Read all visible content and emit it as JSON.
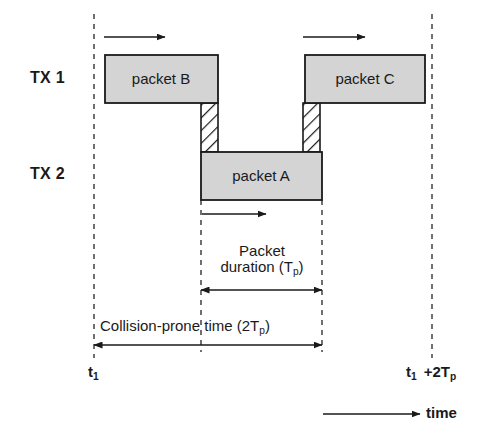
{
  "figure": {
    "type": "timing-diagram",
    "title_text": "",
    "background_color": "#ffffff",
    "line_color": "#1a1a1a",
    "box_fill_color": "#d4d4d4",
    "box_stroke_color": "#1a1a1a",
    "hatch_fill_color": "#ffffff",
    "dashed_guide_color": "#4d4d4d"
  },
  "rows": [
    {
      "id": "tx1",
      "label": "TX 1",
      "label_x": 30,
      "label_y": 70
    },
    {
      "id": "tx2",
      "label": "TX 2",
      "label_x": 30,
      "label_y": 166
    }
  ],
  "guides": [
    {
      "id": "t1-line",
      "x": 94,
      "y1": 14,
      "y2": 358
    },
    {
      "id": "packet-start",
      "x": 201,
      "y1": 200,
      "y2": 352
    },
    {
      "id": "packet-end",
      "x": 322,
      "y1": 200,
      "y2": 352
    },
    {
      "id": "t1-plus-2tp",
      "x": 432,
      "y1": 14,
      "y2": 358
    }
  ],
  "packets": [
    {
      "id": "packet-b",
      "label": "packet B",
      "row": "tx1",
      "x": 105,
      "y": 55,
      "w": 113,
      "h": 48
    },
    {
      "id": "packet-c",
      "label": "packet C",
      "row": "tx1",
      "x": 305,
      "y": 55,
      "w": 120,
      "h": 48
    },
    {
      "id": "packet-a",
      "label": "packet A",
      "row": "tx2",
      "x": 201,
      "y": 152,
      "w": 121,
      "h": 48
    }
  ],
  "hatched_regions": [
    {
      "id": "collision-window-left",
      "x": 201,
      "y": 103,
      "w": 17,
      "h": 49
    },
    {
      "id": "collision-window-right",
      "x": 303,
      "y": 103,
      "w": 17,
      "h": 49
    }
  ],
  "propagation_arrows": [
    {
      "id": "arrow-packet-b",
      "x1": 104,
      "y1": 37,
      "x2": 165,
      "y2": 37
    },
    {
      "id": "arrow-packet-c",
      "x1": 303,
      "y1": 37,
      "x2": 365,
      "y2": 37
    },
    {
      "id": "arrow-packet-a",
      "x1": 202,
      "y1": 214,
      "x2": 266,
      "y2": 214
    }
  ],
  "measures": [
    {
      "id": "packet-duration",
      "text_line1": "Packet",
      "text_line2_prefix": "duration (T",
      "text_sub": "p",
      "text_line2_suffix": ")",
      "text_x": 262,
      "text_y": 243,
      "arrow_x1": 201,
      "arrow_x2": 322,
      "arrow_y": 290
    },
    {
      "id": "collision-prone-time",
      "text_line1": "",
      "text_line2_prefix": "Collision-prone time (2T",
      "text_sub": "p",
      "text_line2_suffix": ")",
      "text_x": 210,
      "text_y": 318,
      "arrow_x1": 94,
      "arrow_x2": 322,
      "arrow_y": 345
    }
  ],
  "tick_labels": [
    {
      "id": "t1",
      "prefix": "t",
      "sub": "1",
      "suffix": "",
      "x": 88,
      "y": 364
    },
    {
      "id": "t1-plus-2tp",
      "prefix": "t",
      "sub": "1",
      "suffix": "",
      "x": 406,
      "y": 364
    }
  ],
  "tick_extra": {
    "plus_text_prefix": "+2T",
    "plus_text_sub": "p",
    "x": 428,
    "y": 364
  },
  "time_axis": {
    "label": "time",
    "arrow_x1": 323,
    "arrow_x2": 420,
    "arrow_y": 414,
    "label_x": 426,
    "label_y": 405
  }
}
